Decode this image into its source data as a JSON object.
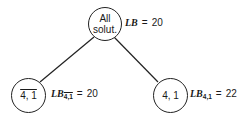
{
  "diagram": {
    "type": "branch-and-bound tree",
    "root": {
      "line1": "All",
      "line2": "solut.",
      "bound_label": "LB",
      "equals": "=",
      "bound_value": "20"
    },
    "children": [
      {
        "text": "4, 1",
        "negated": true,
        "bound_label": "LB",
        "bound_subscript": "4,1",
        "equals": "=",
        "bound_value": "20"
      },
      {
        "text": "4, 1",
        "negated": false,
        "bound_label": "LB",
        "bound_subscript": "4,1",
        "equals": "=",
        "bound_value": "22"
      }
    ]
  }
}
